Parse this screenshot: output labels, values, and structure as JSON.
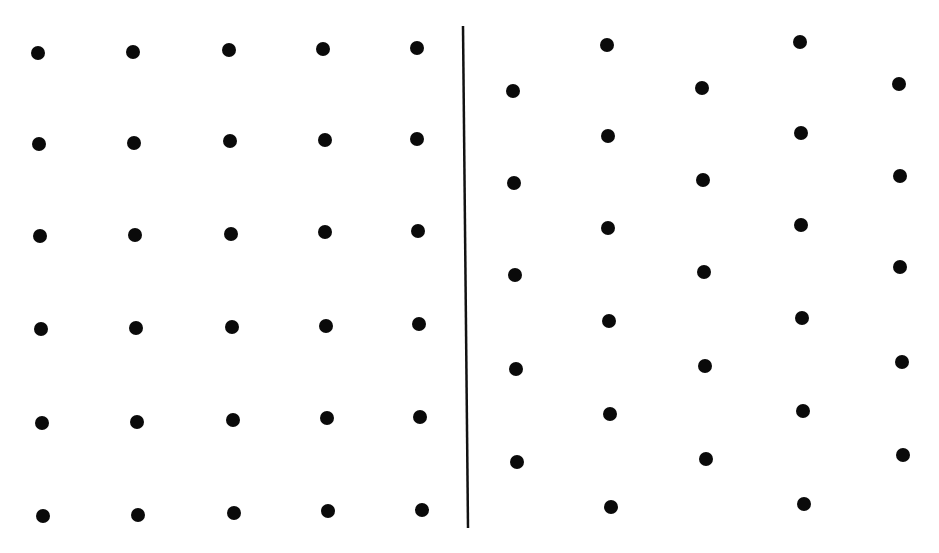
{
  "figure": {
    "background": "#ffffff",
    "dot_color": "#0a0a0a",
    "dot_radius": 7,
    "divider": {
      "x1": 463,
      "y1": 26,
      "x2": 468,
      "y2": 528,
      "color": "#111111",
      "width": 2.5
    },
    "panels": [
      {
        "name": "square-lattice",
        "arrangement": "square",
        "rows": 6,
        "cols": 5,
        "dots": [
          [
            38,
            53
          ],
          [
            133,
            52
          ],
          [
            229,
            50
          ],
          [
            323,
            49
          ],
          [
            417,
            48
          ],
          [
            39,
            144
          ],
          [
            134,
            143
          ],
          [
            230,
            141
          ],
          [
            325,
            140
          ],
          [
            417,
            139
          ],
          [
            40,
            236
          ],
          [
            135,
            235
          ],
          [
            231,
            234
          ],
          [
            325,
            232
          ],
          [
            418,
            231
          ],
          [
            41,
            329
          ],
          [
            136,
            328
          ],
          [
            232,
            327
          ],
          [
            326,
            326
          ],
          [
            419,
            324
          ],
          [
            42,
            423
          ],
          [
            137,
            422
          ],
          [
            233,
            420
          ],
          [
            327,
            418
          ],
          [
            420,
            417
          ],
          [
            43,
            516
          ],
          [
            138,
            515
          ],
          [
            234,
            513
          ],
          [
            328,
            511
          ],
          [
            422,
            510
          ]
        ]
      },
      {
        "name": "hexagonal-lattice",
        "arrangement": "hexagonal",
        "dots": [
          [
            607,
            45
          ],
          [
            800,
            42
          ],
          [
            513,
            91
          ],
          [
            702,
            88
          ],
          [
            899,
            84
          ],
          [
            608,
            136
          ],
          [
            801,
            133
          ],
          [
            514,
            183
          ],
          [
            703,
            180
          ],
          [
            900,
            176
          ],
          [
            608,
            228
          ],
          [
            801,
            225
          ],
          [
            515,
            275
          ],
          [
            704,
            272
          ],
          [
            900,
            267
          ],
          [
            609,
            321
          ],
          [
            802,
            318
          ],
          [
            516,
            369
          ],
          [
            705,
            366
          ],
          [
            902,
            362
          ],
          [
            610,
            414
          ],
          [
            803,
            411
          ],
          [
            517,
            462
          ],
          [
            706,
            459
          ],
          [
            903,
            455
          ],
          [
            611,
            507
          ],
          [
            804,
            504
          ]
        ]
      }
    ]
  }
}
